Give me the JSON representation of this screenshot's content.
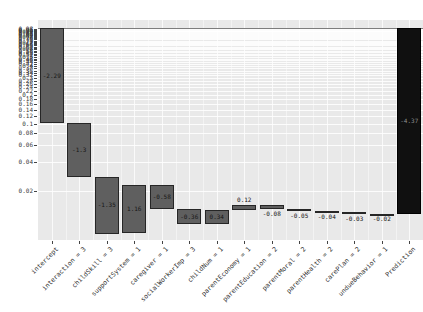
{
  "chart_data": {
    "type": "bar",
    "subtype": "waterfall-breakdown",
    "title": "",
    "xlabel": "",
    "ylabel": "",
    "legend": "none",
    "grid": "on",
    "y_axis": {
      "scale": "log",
      "baseline_value": 1.0,
      "ticks": [
        "0.02",
        "0.04",
        "0.06",
        "0.08",
        "0.1",
        "0.12",
        "0.14",
        "0.16",
        "0.18",
        "0.2",
        "0.22",
        "0.24",
        "0.26",
        "0.28",
        "0.3",
        "0.32",
        "0.34",
        "0.36",
        "0.38",
        "0.4",
        "0.42",
        "0.44",
        "0.46",
        "0.48",
        "0.5",
        "0.52",
        "0.54",
        "0.56",
        "0.58",
        "0.6",
        "0.62",
        "0.64",
        "0.66",
        "0.68",
        "0.7",
        "0.72",
        "0.74",
        "0.76",
        "0.78",
        "0.8",
        "0.82",
        "0.84",
        "0.86",
        "0.88",
        "0.9",
        "0.92",
        "0.94",
        "0.96",
        "0.98"
      ]
    },
    "categories": [
      "intercept",
      "interaction = 3",
      "childSkill = 3",
      "supportSystem = 1",
      "caregiver = 1",
      "socialWorkerImp = 3",
      "childNum = 1",
      "parentEconomy = 1",
      "parentEducation = 2",
      "parentMoral = 2",
      "parentHealth = 2",
      "carePlan = 2",
      "undueBehavior = 1",
      "Prediction"
    ],
    "bars": [
      {
        "category": "intercept",
        "label": "-2.29",
        "value": -2.29,
        "label_pos": "inside",
        "role": "contribution"
      },
      {
        "category": "interaction = 3",
        "label": "-1.3",
        "value": -1.3,
        "label_pos": "inside",
        "role": "contribution"
      },
      {
        "category": "childSkill = 3",
        "label": "-1.35",
        "value": -1.35,
        "label_pos": "inside",
        "role": "contribution"
      },
      {
        "category": "supportSystem = 1",
        "label": "1.16",
        "value": 1.16,
        "label_pos": "inside",
        "role": "contribution"
      },
      {
        "category": "caregiver = 1",
        "label": "-0.58",
        "value": -0.58,
        "label_pos": "inside",
        "role": "contribution"
      },
      {
        "category": "socialWorkerImp = 3",
        "label": "-0.36",
        "value": -0.36,
        "label_pos": "inside",
        "role": "contribution"
      },
      {
        "category": "childNum = 1",
        "label": "0.34",
        "value": 0.34,
        "label_pos": "inside",
        "role": "contribution"
      },
      {
        "category": "parentEconomy = 1",
        "label": "0.12",
        "value": 0.12,
        "label_pos": "above",
        "role": "contribution"
      },
      {
        "category": "parentEducation = 2",
        "label": "-0.08",
        "value": -0.08,
        "label_pos": "below",
        "role": "contribution"
      },
      {
        "category": "parentMoral = 2",
        "label": "-0.05",
        "value": -0.05,
        "label_pos": "below",
        "role": "contribution"
      },
      {
        "category": "parentHealth = 2",
        "label": "-0.04",
        "value": -0.04,
        "label_pos": "below",
        "role": "contribution"
      },
      {
        "category": "carePlan = 2",
        "label": "-0.03",
        "value": -0.03,
        "label_pos": "below",
        "role": "contribution"
      },
      {
        "category": "undueBehavior = 1",
        "label": "-0.02",
        "value": -0.02,
        "label_pos": "below",
        "role": "contribution"
      },
      {
        "category": "Prediction",
        "label": "-4.37",
        "value": null,
        "label_pos": "inside",
        "role": "total"
      }
    ],
    "colors": {
      "panel_bg": "#e9e9e9",
      "grid": "#ffffff",
      "bar_fill": "#5f5f5f",
      "bar_border": "#262626",
      "total_bar_fill": "#101010",
      "baseline_line": "#7d7d7d",
      "value_text": "#161616",
      "total_value_text": "#8f8f8f",
      "axis_text": "#2e2e2e"
    }
  }
}
